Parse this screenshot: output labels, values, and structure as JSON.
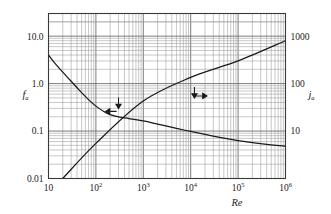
{
  "chart_data": {
    "type": "line",
    "title": "",
    "xlabel": "Re",
    "ylabel_left": "f",
    "ylabel_left_sub": "a",
    "ylabel_right": "j",
    "ylabel_right_sub": "a",
    "xscale": "log",
    "yscale": "log",
    "xlim": [
      10,
      1000000
    ],
    "ylim_left": [
      0.01,
      30
    ],
    "ylim_right": [
      1,
      3000
    ],
    "grid": "log-minor-major-both-axes",
    "legend": "none",
    "xticks": [
      {
        "label": "10",
        "sup": "",
        "value": 10
      },
      {
        "label": "10",
        "sup": "2",
        "value": 100
      },
      {
        "label": "10",
        "sup": "3",
        "value": 1000
      },
      {
        "label": "10",
        "sup": "4",
        "value": 10000
      },
      {
        "label": "10",
        "sup": "5",
        "value": 100000
      },
      {
        "label": "10",
        "sup": "6",
        "value": 1000000
      }
    ],
    "yticks_left": [
      {
        "label": "10.0",
        "value": 10
      },
      {
        "label": "1.0",
        "value": 1
      },
      {
        "label": "0.1",
        "value": 0.1
      },
      {
        "label": "0.01",
        "value": 0.01
      }
    ],
    "yticks_right": [
      {
        "label": "1000",
        "value": 1000
      },
      {
        "label": "100",
        "value": 100
      },
      {
        "label": "10",
        "value": 10
      }
    ],
    "series": [
      {
        "name": "f_a",
        "axis": "left",
        "style": "solid",
        "description": "friction factor, decreasing curve",
        "points": [
          [
            10,
            4.0
          ],
          [
            14,
            2.6
          ],
          [
            20,
            1.75
          ],
          [
            30,
            1.12
          ],
          [
            45,
            0.72
          ],
          [
            70,
            0.46
          ],
          [
            100,
            0.335
          ],
          [
            150,
            0.255
          ],
          [
            200,
            0.222
          ],
          [
            300,
            0.198
          ],
          [
            500,
            0.183
          ],
          [
            1000,
            0.163
          ],
          [
            2000,
            0.14
          ],
          [
            5000,
            0.114
          ],
          [
            10000,
            0.098
          ],
          [
            20000,
            0.085
          ],
          [
            50000,
            0.071
          ],
          [
            100000,
            0.063
          ],
          [
            200000,
            0.057
          ],
          [
            500000,
            0.051
          ],
          [
            1000000,
            0.048
          ]
        ]
      },
      {
        "name": "j_a",
        "axis": "right",
        "style": "solid",
        "description": "Colburn j-factor, increasing straight line",
        "points": [
          [
            20,
            0.01
          ],
          [
            100,
            0.055
          ],
          [
            1000,
            0.43
          ],
          [
            10000,
            1.35
          ],
          [
            100000,
            3.0
          ],
          [
            1000000,
            8.0
          ]
        ]
      }
    ],
    "annotations": [
      {
        "name": "arrow-left-to-f-curve",
        "direction": "left",
        "x": 160,
        "y": 0.26
      },
      {
        "name": "arrow-down-to-f-curve",
        "direction": "down",
        "x": 300,
        "y": 0.3
      },
      {
        "name": "arrow-right-to-j-curve",
        "direction": "right",
        "x": 22000,
        "y": 0.55
      },
      {
        "name": "arrow-down-to-j-curve",
        "direction": "down",
        "x": 12000,
        "y": 0.5
      }
    ]
  },
  "colors": {
    "background": "#ffffff",
    "frame": "#3a3a3a",
    "gridline_major": "#6e6e6e",
    "gridline_minor": "#9a9a9a",
    "curve": "#1a1a1a",
    "text": "#1a1a1a"
  }
}
